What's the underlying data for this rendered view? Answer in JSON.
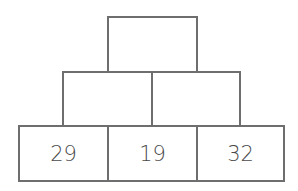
{
  "pyramid": {
    "rows": [
      {
        "cells": [
          {
            "value": ""
          }
        ]
      },
      {
        "cells": [
          {
            "value": ""
          },
          {
            "value": ""
          }
        ]
      },
      {
        "cells": [
          {
            "value": "29"
          },
          {
            "value": "19"
          },
          {
            "value": "32"
          }
        ]
      }
    ]
  },
  "colors": {
    "border": "#6e6e6e",
    "text": "#4a4a4a",
    "background": "#ffffff"
  }
}
